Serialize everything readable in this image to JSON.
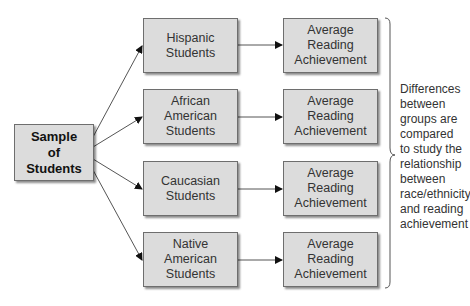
{
  "diagram": {
    "type": "flowchart",
    "source_node": {
      "label": "Sample\nof\nStudents"
    },
    "groups": [
      {
        "label": "Hispanic\nStudents",
        "outcome": "Average\nReading\nAchievement"
      },
      {
        "label": "African\nAmerican\nStudents",
        "outcome": "Average\nReading\nAchievement"
      },
      {
        "label": "Caucasian\nStudents",
        "outcome": "Average\nReading\nAchievement"
      },
      {
        "label": "Native\nAmerican\nStudents",
        "outcome": "Average\nReading\nAchievement"
      }
    ],
    "brace_note": "Differences\nbetween\ngroups are\ncompared\nto study the\nrelationship\nbetween\nrace/ethnicity\nand reading\nachievement"
  },
  "colors": {
    "box_fill": "#dcdcdc",
    "box_border": "#6e6e6e",
    "line": "#444444",
    "text": "#333333"
  }
}
